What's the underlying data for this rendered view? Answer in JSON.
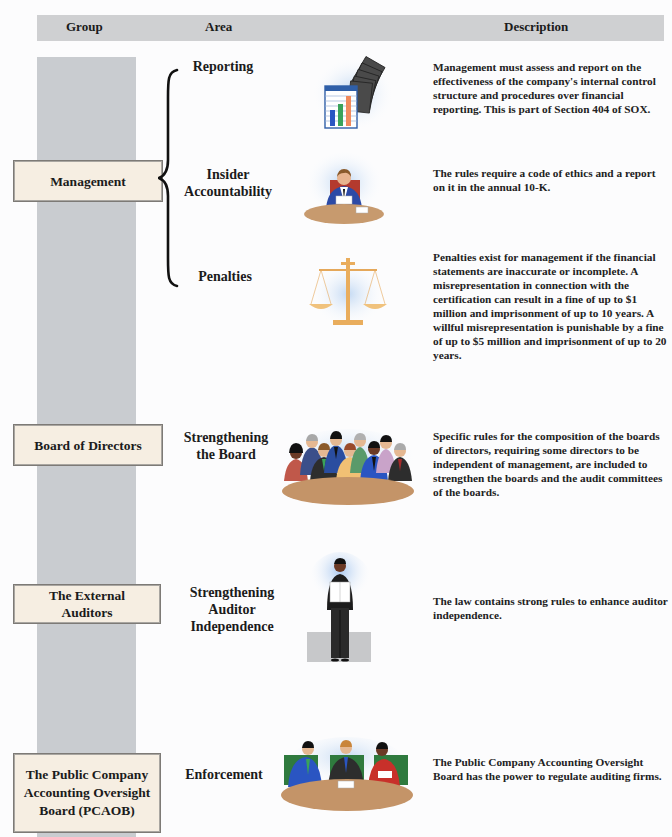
{
  "header": {
    "columns": [
      "Group",
      "Area",
      "Description"
    ]
  },
  "rows": [
    {
      "group": "Management",
      "areas": [
        {
          "area": "Reporting",
          "illustration": "financial-reports-icon",
          "description": "Management must assess and report on the effectiveness of the company's internal control structure and procedures over financial reporting. This is part of Section 404 of SOX."
        },
        {
          "area": "Insider Accountability",
          "illustration": "executive-at-desk-icon",
          "description": "The rules require a code of ethics and a report on it in the annual 10-K."
        },
        {
          "area": "Penalties",
          "illustration": "scales-of-justice-icon",
          "description": "Penalties exist for management if the financial statements are inaccurate or incomplete. A misrepresentation in connection with the certification can result in a fine of up to $1 million and imprisonment of up to 10 years. A willful misrepresentation is punishable by a fine of up to $5 million and imprisonment of up to 20 years."
        }
      ]
    },
    {
      "group": "Board of Directors",
      "areas": [
        {
          "area": "Strengthening the Board",
          "illustration": "board-members-icon",
          "description": "Specific rules for the composition of the boards of directors, requiring some directors to be independent of management, are included to strengthen the boards and the audit committees of the boards."
        }
      ]
    },
    {
      "group": "The External Auditors",
      "areas": [
        {
          "area": "Strengthening Auditor Independence",
          "illustration": "auditor-standing-icon",
          "description": "The law contains strong rules to enhance auditor independence."
        }
      ]
    },
    {
      "group": "The Public Company Accounting Oversight Board (PCAOB)",
      "areas": [
        {
          "area": "Enforcement",
          "illustration": "oversight-board-meeting-icon",
          "description": "The Public Company Accounting Oversight Board has the power to regulate auditing firms."
        }
      ]
    }
  ],
  "colors": {
    "header_bg": "#cfd0d2",
    "spine_bg": "#c9ccd0",
    "group_box_bg": "#f6eee2",
    "text": "#1b1b1b"
  }
}
